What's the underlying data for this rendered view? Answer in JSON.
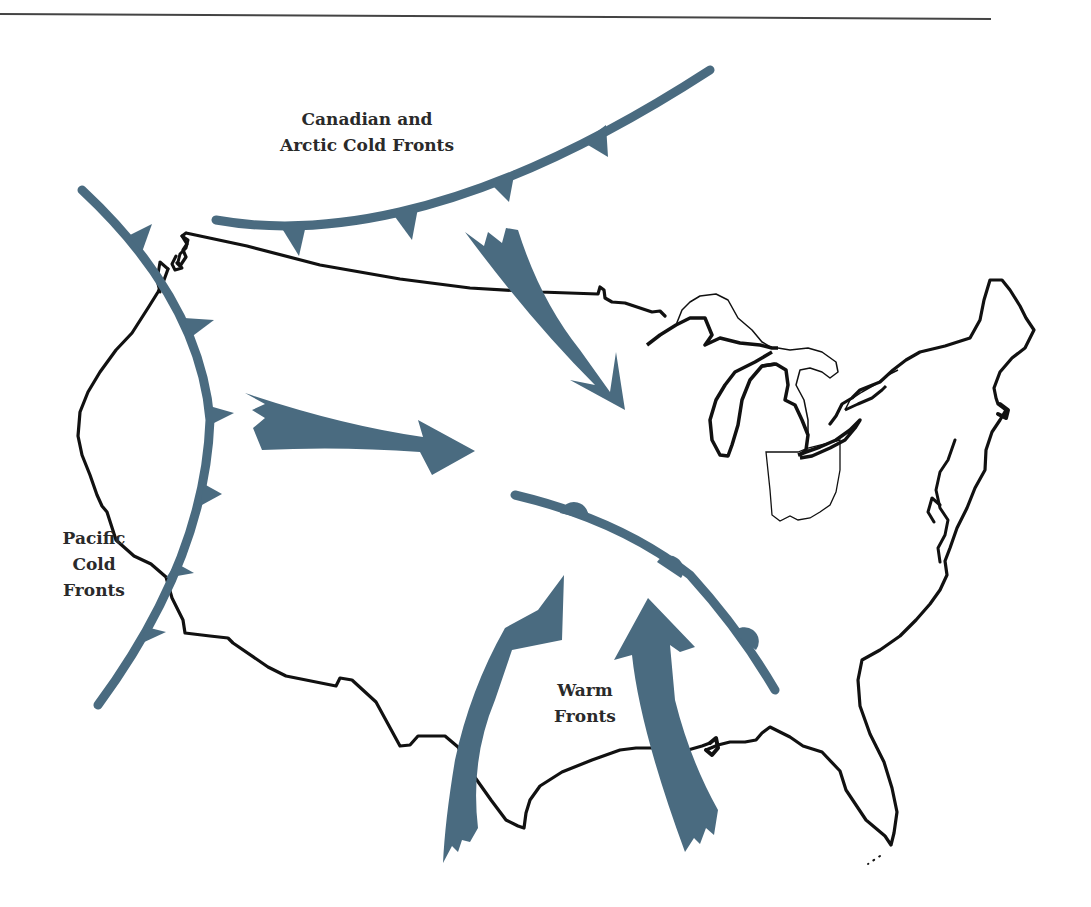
{
  "colors": {
    "front": "#4a6b80",
    "outline": "#111111",
    "background": "#ffffff",
    "text": "#2a2a2a"
  },
  "labels": {
    "canadian": {
      "line1": "Canadian and",
      "line2": "Arctic Cold Fronts"
    },
    "pacific": {
      "line1": "Pacific",
      "line2": "Cold",
      "line3": "Fronts"
    },
    "warm": {
      "line1": "Warm",
      "line2": "Fronts"
    }
  },
  "legend_items": [
    {
      "name": "canadian-arctic-cold-front",
      "type": "cold-front",
      "label": "Canadian and Arctic Cold Fronts"
    },
    {
      "name": "pacific-cold-front",
      "type": "cold-front",
      "label": "Pacific Cold Fronts"
    },
    {
      "name": "warm-front",
      "type": "warm-front",
      "label": "Warm Fronts"
    }
  ],
  "highlighted_state": "Ohio"
}
